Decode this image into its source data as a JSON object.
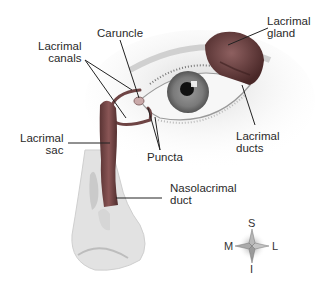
{
  "labels": {
    "caruncle": {
      "lines": [
        "Caruncle"
      ]
    },
    "lacrimal_canals": {
      "lines": [
        "Lacrimal",
        "canals"
      ]
    },
    "lacrimal_gland": {
      "lines": [
        "Lacrimal",
        "gland"
      ]
    },
    "lacrimal_sac": {
      "lines": [
        "Lacrimal",
        "sac"
      ]
    },
    "puncta": {
      "lines": [
        "Puncta"
      ]
    },
    "lacrimal_ducts": {
      "lines": [
        "Lacrimal",
        "ducts"
      ]
    },
    "nasolacrimal_duct": {
      "lines": [
        "Nasolacrimal",
        "duct"
      ]
    }
  },
  "compass": {
    "superior": "S",
    "inferior": "I",
    "medial": "M",
    "lateral": "L"
  },
  "colors": {
    "duct": "#7a4a4a",
    "gland": "#6a3a3a",
    "iris": "#7c7c7c",
    "pupil": "#111111",
    "skin": "#e6e6e6",
    "line": "#222222"
  }
}
